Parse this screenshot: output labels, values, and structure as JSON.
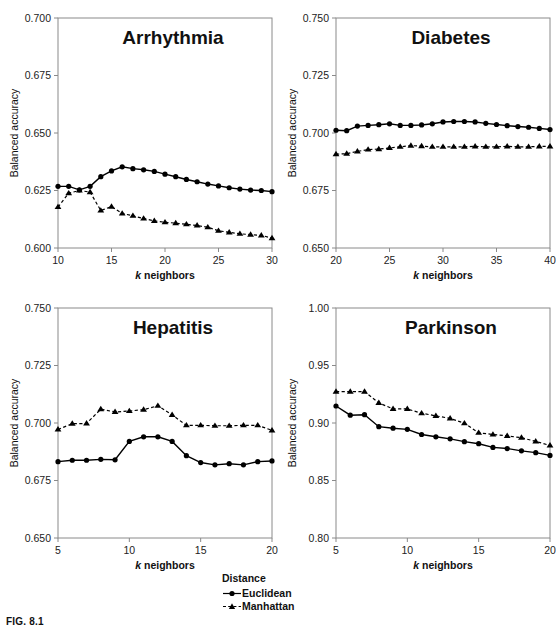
{
  "figure": {
    "caption": "FIG. 8.1",
    "axis_x_label_italic": "k",
    "axis_x_label_rest": " neighbors",
    "axis_y_label": "Balanced accuracy"
  },
  "legend": {
    "title": "Distance",
    "entries": [
      {
        "label": "Euclidean",
        "marker": "circle-marker",
        "line": "solid",
        "color": "#000000"
      },
      {
        "label": "Manhattan",
        "marker": "triangle-marker",
        "line": "dashed",
        "color": "#000000"
      }
    ]
  },
  "chart_data": [
    {
      "type": "line",
      "title": "Arrhythmia",
      "xlabel": "k neighbors",
      "ylabel": "Balanced accuracy",
      "xlim": [
        10,
        30
      ],
      "ylim": [
        0.6,
        0.7
      ],
      "xticks": [
        10,
        15,
        20,
        25,
        30
      ],
      "yticks": [
        0.6,
        0.625,
        0.65,
        0.675,
        0.7
      ],
      "ytick_labels": [
        "0.600",
        "0.625",
        "0.650",
        "0.675",
        "0.700"
      ],
      "xtick_labels": [
        "10",
        "15",
        "20",
        "25",
        "30"
      ],
      "grid": false,
      "x": [
        10,
        11,
        12,
        13,
        14,
        15,
        16,
        17,
        18,
        19,
        20,
        21,
        22,
        23,
        24,
        25,
        26,
        27,
        28,
        29,
        30
      ],
      "series": [
        {
          "name": "Euclidean",
          "marker": "circle",
          "line": "solid",
          "values": [
            0.6268,
            0.6268,
            0.6253,
            0.6268,
            0.631,
            0.6335,
            0.6353,
            0.6345,
            0.634,
            0.6333,
            0.6321,
            0.631,
            0.6298,
            0.6288,
            0.6278,
            0.627,
            0.6262,
            0.6256,
            0.6252,
            0.625,
            0.6245
          ]
        },
        {
          "name": "Manhattan",
          "marker": "triangle",
          "line": "dashed",
          "values": [
            0.6178,
            0.6238,
            0.625,
            0.6243,
            0.6163,
            0.618,
            0.615,
            0.614,
            0.6128,
            0.6118,
            0.6112,
            0.6108,
            0.6103,
            0.6098,
            0.609,
            0.6075,
            0.6068,
            0.6062,
            0.6058,
            0.6055,
            0.6043
          ]
        }
      ]
    },
    {
      "type": "line",
      "title": "Diabetes",
      "xlabel": "k neighbors",
      "ylabel": "Balanced accuracy",
      "xlim": [
        20,
        40
      ],
      "ylim": [
        0.65,
        0.75
      ],
      "xticks": [
        20,
        25,
        30,
        35,
        40
      ],
      "yticks": [
        0.65,
        0.675,
        0.7,
        0.725,
        0.75
      ],
      "ytick_labels": [
        "0.650",
        "0.675",
        "0.700",
        "0.725",
        "0.750"
      ],
      "xtick_labels": [
        "20",
        "25",
        "30",
        "35",
        "40"
      ],
      "grid": false,
      "x": [
        20,
        21,
        22,
        23,
        24,
        25,
        26,
        27,
        28,
        29,
        30,
        31,
        32,
        33,
        34,
        35,
        36,
        37,
        38,
        39,
        40
      ],
      "series": [
        {
          "name": "Euclidean",
          "marker": "circle",
          "line": "solid",
          "values": [
            0.7012,
            0.701,
            0.703,
            0.7033,
            0.7036,
            0.704,
            0.7033,
            0.7033,
            0.7035,
            0.704,
            0.7048,
            0.705,
            0.705,
            0.7048,
            0.7042,
            0.7037,
            0.7032,
            0.7028,
            0.7025,
            0.702,
            0.7015
          ]
        },
        {
          "name": "Manhattan",
          "marker": "triangle",
          "line": "dashed",
          "values": [
            0.6908,
            0.691,
            0.692,
            0.6928,
            0.693,
            0.6935,
            0.694,
            0.6945,
            0.6943,
            0.694,
            0.694,
            0.694,
            0.694,
            0.6942,
            0.694,
            0.694,
            0.6942,
            0.694,
            0.694,
            0.6942,
            0.6942
          ]
        }
      ]
    },
    {
      "type": "line",
      "title": "Hepatitis",
      "xlabel": "k neighbors",
      "ylabel": "Balanced accuracy",
      "xlim": [
        5,
        20
      ],
      "ylim": [
        0.65,
        0.75
      ],
      "xticks": [
        5,
        10,
        15,
        20
      ],
      "yticks": [
        0.65,
        0.675,
        0.7,
        0.725,
        0.75
      ],
      "ytick_labels": [
        "0.650",
        "0.675",
        "0.700",
        "0.725",
        "0.750"
      ],
      "xtick_labels": [
        "5",
        "10",
        "15",
        "20"
      ],
      "grid": false,
      "x": [
        5,
        6,
        7,
        8,
        9,
        10,
        11,
        12,
        13,
        14,
        15,
        16,
        17,
        18,
        19,
        20
      ],
      "series": [
        {
          "name": "Euclidean",
          "marker": "circle",
          "line": "solid",
          "values": [
            0.6832,
            0.6838,
            0.6838,
            0.6842,
            0.684,
            0.692,
            0.694,
            0.694,
            0.692,
            0.6858,
            0.6828,
            0.6818,
            0.6823,
            0.6818,
            0.6832,
            0.6835
          ]
        },
        {
          "name": "Manhattan",
          "marker": "triangle",
          "line": "dashed",
          "values": [
            0.6972,
            0.6997,
            0.6998,
            0.706,
            0.7048,
            0.7052,
            0.7058,
            0.7075,
            0.7035,
            0.699,
            0.699,
            0.6988,
            0.6988,
            0.699,
            0.699,
            0.6968
          ]
        }
      ]
    },
    {
      "type": "line",
      "title": "Parkinson",
      "xlabel": "k neighbors",
      "ylabel": "Balanced accuracy",
      "xlim": [
        5,
        20
      ],
      "ylim": [
        0.8,
        1.0
      ],
      "xticks": [
        5,
        10,
        15,
        20
      ],
      "yticks": [
        0.8,
        0.85,
        0.9,
        0.95,
        1.0
      ],
      "ytick_labels": [
        "0.80",
        "0.85",
        "0.90",
        "0.95",
        "1.00"
      ],
      "xtick_labels": [
        "5",
        "10",
        "15",
        "20"
      ],
      "grid": false,
      "x": [
        5,
        6,
        7,
        8,
        9,
        10,
        11,
        12,
        13,
        14,
        15,
        16,
        17,
        18,
        19,
        20
      ],
      "series": [
        {
          "name": "Euclidean",
          "marker": "circle",
          "line": "solid",
          "values": [
            0.9148,
            0.9068,
            0.9072,
            0.8968,
            0.8955,
            0.8945,
            0.89,
            0.888,
            0.8862,
            0.8838,
            0.882,
            0.8788,
            0.8778,
            0.8758,
            0.8742,
            0.8718
          ]
        },
        {
          "name": "Manhattan",
          "marker": "triangle",
          "line": "dashed",
          "values": [
            0.9272,
            0.9272,
            0.9272,
            0.9175,
            0.9122,
            0.9122,
            0.9085,
            0.9062,
            0.904,
            0.8998,
            0.8915,
            0.89,
            0.8888,
            0.8872,
            0.884,
            0.8805
          ]
        }
      ]
    }
  ]
}
